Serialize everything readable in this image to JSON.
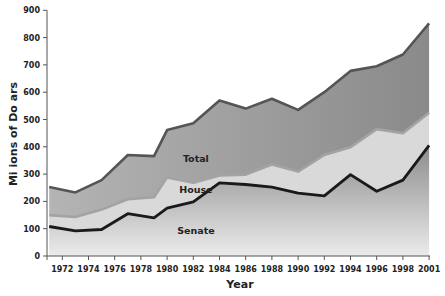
{
  "chart_data": {
    "type": "area",
    "title": "",
    "xlabel": "Year",
    "ylabel": "Mi ions of Do ars",
    "ylim": [
      0,
      900
    ],
    "yticks": [
      0,
      100,
      200,
      300,
      400,
      500,
      600,
      700,
      800,
      900
    ],
    "xticks": [
      {
        "label": "1972",
        "year": 1972
      },
      {
        "label": "1974",
        "year": 1974
      },
      {
        "label": "1976",
        "year": 1976
      },
      {
        "label": "1978",
        "year": 1978
      },
      {
        "label": "1980",
        "year": 1980
      },
      {
        "label": "1982",
        "year": 1982
      },
      {
        "label": "1984",
        "year": 1984
      },
      {
        "label": "1986",
        "year": 1986
      },
      {
        "label": "1988",
        "year": 1988
      },
      {
        "label": "1990",
        "year": 1990
      },
      {
        "label": "1992",
        "year": 1992
      },
      {
        "label": "1994",
        "year": 1994
      },
      {
        "label": "1996",
        "year": 1996
      },
      {
        "label": "1998",
        "year": 1998
      },
      {
        "label": "2001",
        "year": 2000
      }
    ],
    "x": [
      1971,
      1973,
      1975,
      1977,
      1979,
      1980,
      1982,
      1984,
      1986,
      1988,
      1990,
      1992,
      1994,
      1996,
      1998,
      2000
    ],
    "series": [
      {
        "name": "Total",
        "values": [
          253,
          233,
          278,
          370,
          366,
          461,
          486,
          570,
          540,
          576,
          535,
          600,
          678,
          695,
          738,
          852
        ]
      },
      {
        "name": "House",
        "values": [
          150,
          143,
          170,
          208,
          215,
          288,
          268,
          295,
          298,
          335,
          309,
          370,
          398,
          465,
          450,
          525
        ]
      },
      {
        "name": "Senate",
        "values": [
          108,
          92,
          97,
          155,
          140,
          175,
          198,
          268,
          262,
          252,
          230,
          220,
          298,
          237,
          278,
          405
        ]
      }
    ],
    "annotations": [
      {
        "text": "Total",
        "x": 1982.2,
        "y": 355
      },
      {
        "text": "House",
        "x": 1982.2,
        "y": 242
      },
      {
        "text": "Senate",
        "x": 1982.2,
        "y": 90
      }
    ],
    "grid": false,
    "legend": "none (inline labels)",
    "colors": {
      "total_fill_top": "#8a8a8a",
      "total_fill_bottom": "#b4b4b4",
      "house_fill": "#d9d9d9",
      "senate_fill_top": "#8c8c8c",
      "senate_fill_bottom": "#ebebeb",
      "total_line": "#555555",
      "house_line": "#a3a3a3",
      "senate_line": "#1a1a1a",
      "axis": "#555555"
    }
  }
}
